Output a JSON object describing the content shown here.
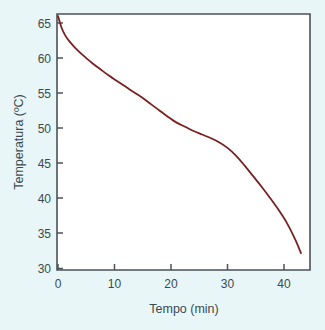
{
  "chart_data": {
    "type": "line",
    "title": "",
    "xlabel": "Tempo (min)",
    "ylabel": "Temperatura (ºC)",
    "xlim": [
      -1.5,
      45
    ],
    "ylim": [
      30,
      66.5
    ],
    "xticks": [
      0,
      10,
      20,
      30,
      40
    ],
    "yticks": [
      30,
      35,
      40,
      45,
      50,
      55,
      60,
      65
    ],
    "xtick_labels": [
      "0",
      "10",
      "20",
      "30",
      "40"
    ],
    "ytick_labels": [
      "30",
      "35",
      "40",
      "45",
      "50",
      "55",
      "60",
      "65"
    ],
    "grid": false,
    "legend": null,
    "series": [
      {
        "name": "curva de arrefecimento",
        "color": "#7a2020",
        "x": [
          0,
          0.6,
          1.3,
          2.1,
          3.0,
          4.0,
          5.0,
          6.2,
          7.5,
          9.0,
          10.5,
          12.0,
          13.5,
          15.0,
          16.5,
          18.0,
          19.5,
          21.0,
          22.5,
          24.0,
          25.5,
          27.0,
          28.5,
          30.0,
          31.5,
          33.0,
          34.5,
          36.0,
          37.5,
          39.0,
          40.5,
          42.0,
          43.0
        ],
        "y": [
          66.0,
          64.4,
          63.2,
          62.3,
          61.5,
          60.7,
          60.0,
          59.2,
          58.4,
          57.5,
          56.7,
          55.9,
          55.1,
          54.3,
          53.4,
          52.5,
          51.6,
          50.8,
          50.2,
          49.6,
          49.1,
          48.6,
          48.0,
          47.2,
          46.1,
          44.7,
          43.2,
          41.7,
          40.1,
          38.4,
          36.5,
          34.1,
          32.2
        ]
      }
    ]
  },
  "axes": {
    "y_label": "Temperatura (ºC)",
    "x_label": "Tempo (min)"
  },
  "colors": {
    "background": "#e8f6f8",
    "plot_area": "#ffffff",
    "frame": "#4a5256",
    "curve": "#7a2020",
    "text": "#3c4a4f"
  }
}
